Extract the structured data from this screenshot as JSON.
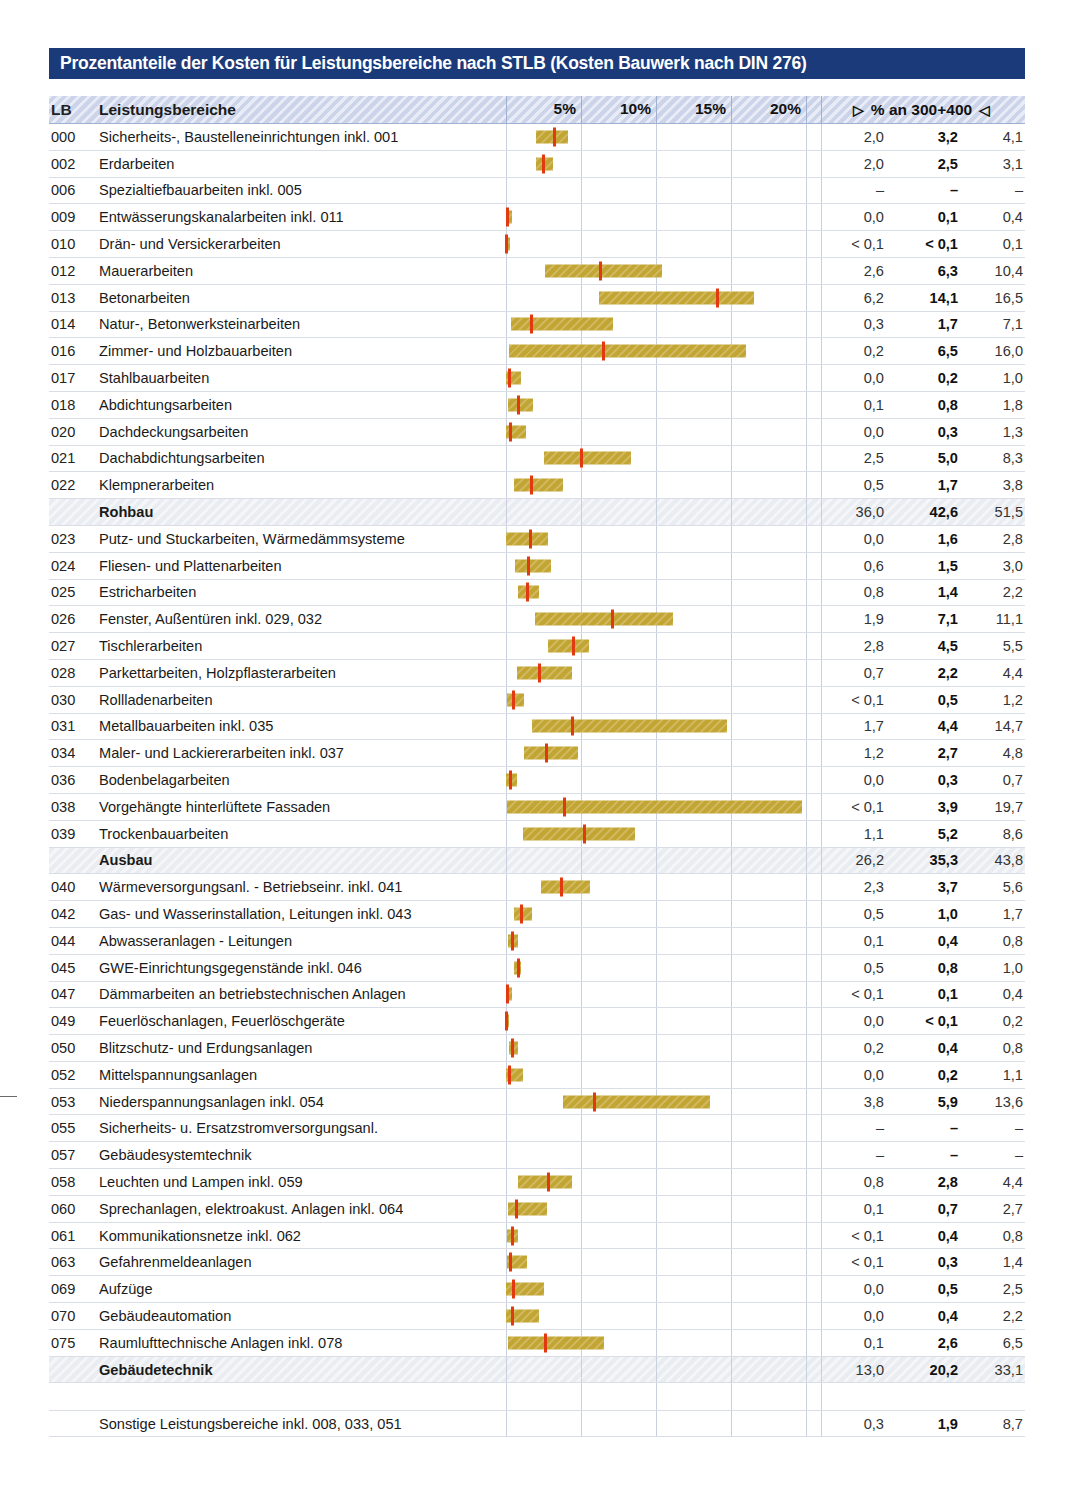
{
  "title": "Prozentanteile der Kosten für Leistungsbereiche nach STLB (Kosten Bauwerk nach DIN 276)",
  "header": {
    "lb": "LB",
    "name": "Leistungsbereiche",
    "right_label": "% an 300+400",
    "left_triangle": "▷",
    "right_triangle": "◁"
  },
  "chart_data": {
    "type": "bar",
    "title": "Prozentanteile der Kosten für Leistungsbereiche nach STLB (Kosten Bauwerk nach DIN 276)",
    "xlabel": "% an 300+400",
    "ylabel": "Leistungsbereiche",
    "xlim": [
      0,
      21.5
    ],
    "grid": true,
    "legend": "none",
    "axis_ticks": [
      "5%",
      "10%",
      "15%",
      "20%"
    ],
    "axis_tick_values": [
      5,
      10,
      15,
      20
    ],
    "columns": [
      "min",
      "mittel",
      "max"
    ],
    "bar_color": "#c3a534",
    "marker_color": "#e23a10",
    "header_color": "#ccd4ea",
    "title_color": "#1b3a7a",
    "rows": [
      {
        "lb": "000",
        "name": "Sicherheits-, Baustelleneinrichtungen inkl. 001",
        "min": "2,0",
        "mean": "3,2",
        "max": "4,1",
        "min_v": 2.0,
        "mean_v": 3.2,
        "max_v": 4.1,
        "type": "item"
      },
      {
        "lb": "002",
        "name": "Erdarbeiten",
        "min": "2,0",
        "mean": "2,5",
        "max": "3,1",
        "min_v": 2.0,
        "mean_v": 2.5,
        "max_v": 3.1,
        "type": "item"
      },
      {
        "lb": "006",
        "name": "Spezialtiefbauarbeiten inkl. 005",
        "min": "–",
        "mean": "–",
        "max": "–",
        "min_v": null,
        "mean_v": null,
        "max_v": null,
        "type": "item"
      },
      {
        "lb": "009",
        "name": "Entwässerungskanalarbeiten inkl. 011",
        "min": "0,0",
        "mean": "0,1",
        "max": "0,4",
        "min_v": 0.0,
        "mean_v": 0.1,
        "max_v": 0.4,
        "type": "item"
      },
      {
        "lb": "010",
        "name": "Drän- und Versickerarbeiten",
        "min": "< 0,1",
        "mean": "< 0,1",
        "max": "0,1",
        "min_v": 0.05,
        "mean_v": 0.05,
        "max_v": 0.1,
        "type": "item"
      },
      {
        "lb": "012",
        "name": "Mauerarbeiten",
        "min": "2,6",
        "mean": "6,3",
        "max": "10,4",
        "min_v": 2.6,
        "mean_v": 6.3,
        "max_v": 10.4,
        "type": "item"
      },
      {
        "lb": "013",
        "name": "Betonarbeiten",
        "min": "6,2",
        "mean": "14,1",
        "max": "16,5",
        "min_v": 6.2,
        "mean_v": 14.1,
        "max_v": 16.5,
        "type": "item"
      },
      {
        "lb": "014",
        "name": "Natur-, Betonwerksteinarbeiten",
        "min": "0,3",
        "mean": "1,7",
        "max": "7,1",
        "min_v": 0.3,
        "mean_v": 1.7,
        "max_v": 7.1,
        "type": "item"
      },
      {
        "lb": "016",
        "name": "Zimmer- und Holzbauarbeiten",
        "min": "0,2",
        "mean": "6,5",
        "max": "16,0",
        "min_v": 0.2,
        "mean_v": 6.5,
        "max_v": 16.0,
        "type": "item"
      },
      {
        "lb": "017",
        "name": "Stahlbauarbeiten",
        "min": "0,0",
        "mean": "0,2",
        "max": "1,0",
        "min_v": 0.0,
        "mean_v": 0.2,
        "max_v": 1.0,
        "type": "item"
      },
      {
        "lb": "018",
        "name": "Abdichtungsarbeiten",
        "min": "0,1",
        "mean": "0,8",
        "max": "1,8",
        "min_v": 0.1,
        "mean_v": 0.8,
        "max_v": 1.8,
        "type": "item"
      },
      {
        "lb": "020",
        "name": "Dachdeckungsarbeiten",
        "min": "0,0",
        "mean": "0,3",
        "max": "1,3",
        "min_v": 0.0,
        "mean_v": 0.3,
        "max_v": 1.3,
        "type": "item"
      },
      {
        "lb": "021",
        "name": "Dachabdichtungsarbeiten",
        "min": "2,5",
        "mean": "5,0",
        "max": "8,3",
        "min_v": 2.5,
        "mean_v": 5.0,
        "max_v": 8.3,
        "type": "item"
      },
      {
        "lb": "022",
        "name": "Klempnerarbeiten",
        "min": "0,5",
        "mean": "1,7",
        "max": "3,8",
        "min_v": 0.5,
        "mean_v": 1.7,
        "max_v": 3.8,
        "type": "item"
      },
      {
        "lb": "",
        "name": "Rohbau",
        "min": "36,0",
        "mean": "42,6",
        "max": "51,5",
        "min_v": null,
        "mean_v": null,
        "max_v": null,
        "type": "summary"
      },
      {
        "lb": "023",
        "name": "Putz- und Stuckarbeiten, Wärmedämmsysteme",
        "min": "0,0",
        "mean": "1,6",
        "max": "2,8",
        "min_v": 0.0,
        "mean_v": 1.6,
        "max_v": 2.8,
        "type": "item"
      },
      {
        "lb": "024",
        "name": "Fliesen- und Plattenarbeiten",
        "min": "0,6",
        "mean": "1,5",
        "max": "3,0",
        "min_v": 0.6,
        "mean_v": 1.5,
        "max_v": 3.0,
        "type": "item"
      },
      {
        "lb": "025",
        "name": "Estricharbeiten",
        "min": "0,8",
        "mean": "1,4",
        "max": "2,2",
        "min_v": 0.8,
        "mean_v": 1.4,
        "max_v": 2.2,
        "type": "item"
      },
      {
        "lb": "026",
        "name": "Fenster, Außentüren inkl. 029, 032",
        "min": "1,9",
        "mean": "7,1",
        "max": "11,1",
        "min_v": 1.9,
        "mean_v": 7.1,
        "max_v": 11.1,
        "type": "item"
      },
      {
        "lb": "027",
        "name": "Tischlerarbeiten",
        "min": "2,8",
        "mean": "4,5",
        "max": "5,5",
        "min_v": 2.8,
        "mean_v": 4.5,
        "max_v": 5.5,
        "type": "item"
      },
      {
        "lb": "028",
        "name": "Parkettarbeiten, Holzpflasterarbeiten",
        "min": "0,7",
        "mean": "2,2",
        "max": "4,4",
        "min_v": 0.7,
        "mean_v": 2.2,
        "max_v": 4.4,
        "type": "item"
      },
      {
        "lb": "030",
        "name": "Rollladenarbeiten",
        "min": "< 0,1",
        "mean": "0,5",
        "max": "1,2",
        "min_v": 0.05,
        "mean_v": 0.5,
        "max_v": 1.2,
        "type": "item"
      },
      {
        "lb": "031",
        "name": "Metallbauarbeiten inkl. 035",
        "min": "1,7",
        "mean": "4,4",
        "max": "14,7",
        "min_v": 1.7,
        "mean_v": 4.4,
        "max_v": 14.7,
        "type": "item"
      },
      {
        "lb": "034",
        "name": "Maler- und Lackiererarbeiten inkl. 037",
        "min": "1,2",
        "mean": "2,7",
        "max": "4,8",
        "min_v": 1.2,
        "mean_v": 2.7,
        "max_v": 4.8,
        "type": "item"
      },
      {
        "lb": "036",
        "name": "Bodenbelagarbeiten",
        "min": "0,0",
        "mean": "0,3",
        "max": "0,7",
        "min_v": 0.0,
        "mean_v": 0.3,
        "max_v": 0.7,
        "type": "item"
      },
      {
        "lb": "038",
        "name": "Vorgehängte hinterlüftete Fassaden",
        "min": "< 0,1",
        "mean": "3,9",
        "max": "19,7",
        "min_v": 0.05,
        "mean_v": 3.9,
        "max_v": 19.7,
        "type": "item"
      },
      {
        "lb": "039",
        "name": "Trockenbauarbeiten",
        "min": "1,1",
        "mean": "5,2",
        "max": "8,6",
        "min_v": 1.1,
        "mean_v": 5.2,
        "max_v": 8.6,
        "type": "item"
      },
      {
        "lb": "",
        "name": "Ausbau",
        "min": "26,2",
        "mean": "35,3",
        "max": "43,8",
        "min_v": null,
        "mean_v": null,
        "max_v": null,
        "type": "summary"
      },
      {
        "lb": "040",
        "name": "Wärmeversorgungsanl. - Betriebseinr. inkl. 041",
        "min": "2,3",
        "mean": "3,7",
        "max": "5,6",
        "min_v": 2.3,
        "mean_v": 3.7,
        "max_v": 5.6,
        "type": "item"
      },
      {
        "lb": "042",
        "name": "Gas- und Wasserinstallation, Leitungen inkl. 043",
        "min": "0,5",
        "mean": "1,0",
        "max": "1,7",
        "min_v": 0.5,
        "mean_v": 1.0,
        "max_v": 1.7,
        "type": "item"
      },
      {
        "lb": "044",
        "name": "Abwasseranlagen - Leitungen",
        "min": "0,1",
        "mean": "0,4",
        "max": "0,8",
        "min_v": 0.1,
        "mean_v": 0.4,
        "max_v": 0.8,
        "type": "item"
      },
      {
        "lb": "045",
        "name": "GWE-Einrichtungsgegenstände inkl. 046",
        "min": "0,5",
        "mean": "0,8",
        "max": "1,0",
        "min_v": 0.5,
        "mean_v": 0.8,
        "max_v": 1.0,
        "type": "item"
      },
      {
        "lb": "047",
        "name": "Dämmarbeiten an betriebstechnischen Anlagen",
        "min": "< 0,1",
        "mean": "0,1",
        "max": "0,4",
        "min_v": 0.05,
        "mean_v": 0.1,
        "max_v": 0.4,
        "type": "item"
      },
      {
        "lb": "049",
        "name": "Feuerlöschanlagen, Feuerlöschgeräte",
        "min": "0,0",
        "mean": "< 0,1",
        "max": "0,2",
        "min_v": 0.0,
        "mean_v": 0.05,
        "max_v": 0.2,
        "type": "item"
      },
      {
        "lb": "050",
        "name": "Blitzschutz- und Erdungsanlagen",
        "min": "0,2",
        "mean": "0,4",
        "max": "0,8",
        "min_v": 0.2,
        "mean_v": 0.4,
        "max_v": 0.8,
        "type": "item"
      },
      {
        "lb": "052",
        "name": "Mittelspannungsanlagen",
        "min": "0,0",
        "mean": "0,2",
        "max": "1,1",
        "min_v": 0.0,
        "mean_v": 0.2,
        "max_v": 1.1,
        "type": "item"
      },
      {
        "lb": "053",
        "name": "Niederspannungsanlagen inkl. 054",
        "min": "3,8",
        "mean": "5,9",
        "max": "13,6",
        "min_v": 3.8,
        "mean_v": 5.9,
        "max_v": 13.6,
        "type": "item"
      },
      {
        "lb": "055",
        "name": "Sicherheits- u. Ersatzstromversorgungsanl.",
        "min": "–",
        "mean": "–",
        "max": "–",
        "min_v": null,
        "mean_v": null,
        "max_v": null,
        "type": "item"
      },
      {
        "lb": "057",
        "name": "Gebäudesystemtechnik",
        "min": "–",
        "mean": "–",
        "max": "–",
        "min_v": null,
        "mean_v": null,
        "max_v": null,
        "type": "item"
      },
      {
        "lb": "058",
        "name": "Leuchten und Lampen inkl. 059",
        "min": "0,8",
        "mean": "2,8",
        "max": "4,4",
        "min_v": 0.8,
        "mean_v": 2.8,
        "max_v": 4.4,
        "type": "item"
      },
      {
        "lb": "060",
        "name": "Sprechanlagen, elektroakust. Anlagen inkl. 064",
        "min": "0,1",
        "mean": "0,7",
        "max": "2,7",
        "min_v": 0.1,
        "mean_v": 0.7,
        "max_v": 2.7,
        "type": "item"
      },
      {
        "lb": "061",
        "name": "Kommunikationsnetze inkl. 062",
        "min": "< 0,1",
        "mean": "0,4",
        "max": "0,8",
        "min_v": 0.05,
        "mean_v": 0.4,
        "max_v": 0.8,
        "type": "item"
      },
      {
        "lb": "063",
        "name": "Gefahrenmeldeanlagen",
        "min": "< 0,1",
        "mean": "0,3",
        "max": "1,4",
        "min_v": 0.05,
        "mean_v": 0.3,
        "max_v": 1.4,
        "type": "item"
      },
      {
        "lb": "069",
        "name": "Aufzüge",
        "min": "0,0",
        "mean": "0,5",
        "max": "2,5",
        "min_v": 0.0,
        "mean_v": 0.5,
        "max_v": 2.5,
        "type": "item"
      },
      {
        "lb": "070",
        "name": "Gebäudeautomation",
        "min": "0,0",
        "mean": "0,4",
        "max": "2,2",
        "min_v": 0.0,
        "mean_v": 0.4,
        "max_v": 2.2,
        "type": "item"
      },
      {
        "lb": "075",
        "name": "Raumlufttechnische Anlagen inkl. 078",
        "min": "0,1",
        "mean": "2,6",
        "max": "6,5",
        "min_v": 0.1,
        "mean_v": 2.6,
        "max_v": 6.5,
        "type": "item"
      },
      {
        "lb": "",
        "name": "Gebäudetechnik",
        "min": "13,0",
        "mean": "20,2",
        "max": "33,1",
        "min_v": null,
        "mean_v": null,
        "max_v": null,
        "type": "summary"
      },
      {
        "lb": "",
        "name": "",
        "min": "",
        "mean": "",
        "max": "",
        "min_v": null,
        "mean_v": null,
        "max_v": null,
        "type": "spacer"
      },
      {
        "lb": "",
        "name": "Sonstige Leistungsbereiche inkl. 008, 033, 051",
        "min": "0,3",
        "mean": "1,9",
        "max": "8,7",
        "min_v": null,
        "mean_v": null,
        "max_v": null,
        "type": "last"
      }
    ]
  }
}
